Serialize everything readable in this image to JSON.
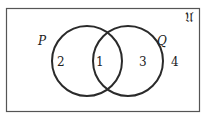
{
  "diagram": {
    "type": "venn",
    "universe_label": "𝔘",
    "sets": [
      {
        "name": "P",
        "label": "P"
      },
      {
        "name": "Q",
        "label": "Q"
      }
    ],
    "regions": [
      {
        "id": "P-only",
        "label": "2"
      },
      {
        "id": "P-and-Q",
        "label": "1"
      },
      {
        "id": "Q-only",
        "label": "3"
      },
      {
        "id": "outside",
        "label": "4"
      }
    ],
    "colors": {
      "stroke": "#2a2a2a",
      "background": "#ffffff"
    }
  }
}
